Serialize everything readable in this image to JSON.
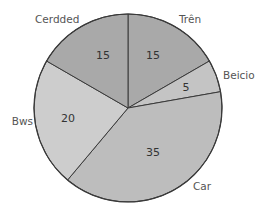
{
  "chart_data": {
    "type": "pie",
    "title": "",
    "start_angle_deg": 0,
    "direction": "clockwise",
    "total": 90,
    "slices": [
      {
        "label": "Trên",
        "value": 15,
        "color": "#a9a9a9",
        "label_pos": [
          179,
          20
        ],
        "label_anchor": "start",
        "value_pos": [
          153,
          56
        ]
      },
      {
        "label": "Beicio",
        "value": 5,
        "color": "#c4c4c4",
        "label_pos": [
          223,
          76
        ],
        "label_anchor": "start",
        "value_pos": [
          186,
          88
        ]
      },
      {
        "label": "Car",
        "value": 35,
        "color": "#bdbdbd",
        "label_pos": [
          193,
          187
        ],
        "label_anchor": "start",
        "value_pos": [
          153,
          153
        ]
      },
      {
        "label": "Bws",
        "value": 20,
        "color": "#cdcdcd",
        "label_pos": [
          33,
          122
        ],
        "label_anchor": "end",
        "value_pos": [
          68,
          119
        ]
      },
      {
        "label": "Cerdded",
        "value": 15,
        "color": "#a9a9a9",
        "label_pos": [
          35,
          20
        ],
        "label_anchor": "start",
        "value_pos": [
          103,
          56
        ]
      }
    ],
    "geometry": {
      "cx": 128,
      "cy": 108,
      "r": 94
    }
  }
}
